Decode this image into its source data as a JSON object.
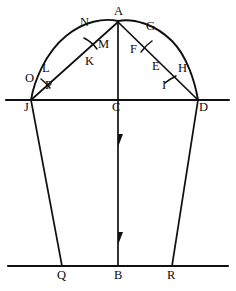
{
  "figure": {
    "background_color": "#ffffff",
    "stroke_color": "#101010",
    "width": 236,
    "height": 291
  },
  "labels": {
    "A": "A",
    "B": "B",
    "C": "C",
    "D": "D",
    "E": "E",
    "F": "F",
    "G": "G",
    "H": "H",
    "I": "I",
    "J": "J",
    "K": "K",
    "L": "L",
    "M": "M",
    "N": "N",
    "O": "O",
    "P": "P",
    "Q": "Q",
    "R": "R"
  },
  "points": [
    {
      "name": "A",
      "label": "A",
      "x": 118,
      "y": 22,
      "role": "apex-vertex"
    },
    {
      "name": "N",
      "label": "N",
      "x": 85,
      "y": 27,
      "role": "arc-point-left"
    },
    {
      "name": "G",
      "label": "G",
      "x": 150,
      "y": 30,
      "role": "arc-point-right"
    },
    {
      "name": "M",
      "label": "M",
      "x": 102,
      "y": 45,
      "role": "chord-point-left"
    },
    {
      "name": "F",
      "label": "F",
      "x": 134,
      "y": 50,
      "role": "chord-point-right"
    },
    {
      "name": "K",
      "label": "K",
      "x": 89,
      "y": 62,
      "role": "chord-point-left-lower"
    },
    {
      "name": "E",
      "label": "E",
      "x": 156,
      "y": 68,
      "role": "arc-chord-intersection-right"
    },
    {
      "name": "H",
      "label": "H",
      "x": 182,
      "y": 70,
      "role": "arc-point-right-lower"
    },
    {
      "name": "L",
      "label": "L",
      "x": 46,
      "y": 71,
      "role": "arc-point-left-lower"
    },
    {
      "name": "O",
      "label": "O",
      "x": 29,
      "y": 80,
      "role": "arc-point-left-foot"
    },
    {
      "name": "I",
      "label": "I",
      "x": 166,
      "y": 86,
      "role": "chord-point-right-foot"
    },
    {
      "name": "P",
      "label": "P",
      "x": 49,
      "y": 86,
      "role": "chord-point-left-foot"
    },
    {
      "name": "J",
      "label": "J",
      "x": 31,
      "y": 100,
      "role": "base-left-vertex"
    },
    {
      "name": "C",
      "label": "C",
      "x": 118,
      "y": 100,
      "role": "base-midpoint"
    },
    {
      "name": "D",
      "label": "D",
      "x": 198,
      "y": 100,
      "role": "base-right-vertex"
    },
    {
      "name": "Q",
      "label": "Q",
      "x": 62,
      "y": 266,
      "role": "bottom-left-vertex"
    },
    {
      "name": "B",
      "label": "B",
      "x": 118,
      "y": 266,
      "role": "bottom-midpoint"
    },
    {
      "name": "R",
      "label": "R",
      "x": 172,
      "y": 266,
      "role": "bottom-right-vertex"
    }
  ],
  "segments": [
    {
      "name": "upper-horizontal-line",
      "from": "line-left-end",
      "to": "line-right-end"
    },
    {
      "name": "lower-horizontal-line",
      "from": "base-left-end",
      "to": "base-right-end"
    },
    {
      "name": "arc-J-A-D",
      "type": "curve"
    },
    {
      "name": "chord-J-A",
      "type": "line"
    },
    {
      "name": "chord-A-D",
      "type": "line"
    },
    {
      "name": "vertical-A-C-B",
      "type": "line-with-arrows"
    },
    {
      "name": "leg-J-Q",
      "type": "line"
    },
    {
      "name": "leg-D-R",
      "type": "line"
    }
  ]
}
